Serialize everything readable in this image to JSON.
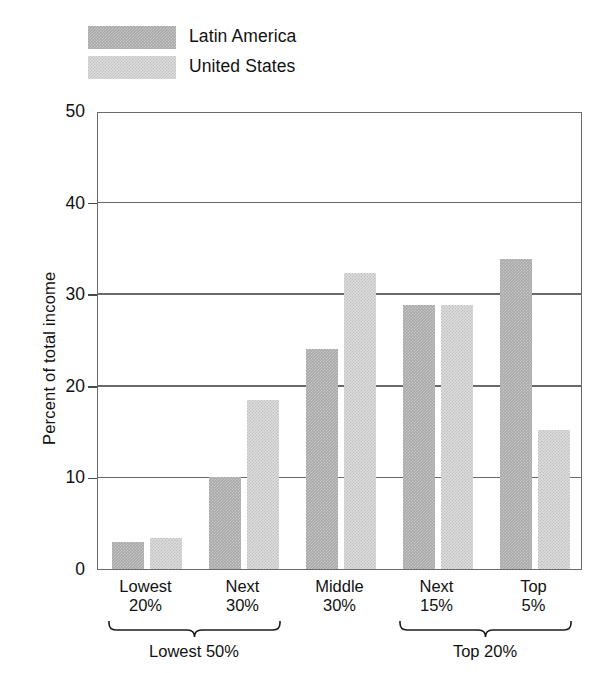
{
  "chart_data": {
    "type": "bar",
    "title": "",
    "subtitle": "",
    "xlabel": "",
    "ylabel": "Percent of total income",
    "ylim": [
      0,
      50
    ],
    "yticks": [
      0,
      10,
      20,
      30,
      40,
      50
    ],
    "ytick_labels": [
      "0",
      "10",
      "20",
      "30",
      "40",
      "50"
    ],
    "grid": true,
    "grid_axis": "y",
    "legend_position": "top-left",
    "categories": [
      "Lowest 20%",
      "Next 30%",
      "Middle 30%",
      "Next 15%",
      "Top 5%"
    ],
    "category_lines": [
      [
        "Lowest",
        "20%"
      ],
      [
        "Next",
        "30%"
      ],
      [
        "Middle",
        "30%"
      ],
      [
        "Next",
        "15%"
      ],
      [
        "Top",
        "5%"
      ]
    ],
    "series": [
      {
        "name": "Latin America",
        "color": "#a9a9a9",
        "values": [
          2.9,
          10.0,
          24.0,
          28.8,
          33.8
        ]
      },
      {
        "name": "United States",
        "color": "#dcdcdc",
        "values": [
          3.4,
          18.4,
          32.3,
          28.8,
          15.2
        ]
      }
    ],
    "annotations": [
      {
        "label": "Lowest 50%",
        "spans": [
          "Lowest 20%",
          "Next 30%"
        ]
      },
      {
        "label": "Top 20%",
        "spans": [
          "Next 15%",
          "Top 5%"
        ]
      }
    ]
  },
  "legend": {
    "items": [
      {
        "label": "Latin America",
        "swatch": "dark"
      },
      {
        "label": "United States",
        "swatch": "light"
      }
    ]
  }
}
